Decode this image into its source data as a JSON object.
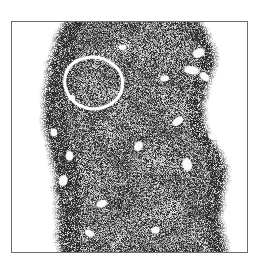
{
  "figure": {
    "domain": "Natural-Image",
    "kind": "histopathology-micrograph",
    "caption": "",
    "modality": "light microscopy, grayscale",
    "title": ""
  },
  "frame": {
    "x": 11,
    "y": 21,
    "width": 237,
    "height": 232,
    "border_color": "#6b6b6b",
    "border_width": 1,
    "background_color": "#ffffff"
  },
  "image": {
    "background_color": "#ffffff",
    "tissue_mid_gray": "#8f8f8f",
    "tissue_dark_gray": "#3a3a3a",
    "tissue_light_gray": "#c9c9c9",
    "speckle_black": "#1a1a1a",
    "lacuna_white": "#fbfbfb",
    "description": "Dense speckled lymphoid tissue band running top to bottom, occupying the left-centre through right of the frame, with white slide background along the left margin and upper-right corner.",
    "tissue_outline_left": [
      [
        0.2,
        0.0
      ],
      [
        0.165,
        0.06
      ],
      [
        0.145,
        0.13
      ],
      [
        0.125,
        0.21
      ],
      [
        0.115,
        0.3
      ],
      [
        0.112,
        0.39
      ],
      [
        0.118,
        0.47
      ],
      [
        0.132,
        0.55
      ],
      [
        0.15,
        0.62
      ],
      [
        0.162,
        0.69
      ],
      [
        0.168,
        0.76
      ],
      [
        0.17,
        0.84
      ],
      [
        0.172,
        0.92
      ],
      [
        0.178,
        1.0
      ]
    ],
    "tissue_outline_right": [
      [
        0.82,
        0.0
      ],
      [
        0.855,
        0.05
      ],
      [
        0.875,
        0.11
      ],
      [
        0.88,
        0.18
      ],
      [
        0.862,
        0.25
      ],
      [
        0.84,
        0.32
      ],
      [
        0.832,
        0.39
      ],
      [
        0.845,
        0.46
      ],
      [
        0.88,
        0.52
      ],
      [
        0.915,
        0.58
      ],
      [
        0.935,
        0.64
      ],
      [
        0.93,
        0.71
      ],
      [
        0.912,
        0.78
      ],
      [
        0.905,
        0.85
      ],
      [
        0.915,
        0.92
      ],
      [
        0.93,
        1.0
      ]
    ]
  },
  "annotation": {
    "type": "hand-drawn-circle",
    "color": "#ffffff",
    "stroke_width": 3,
    "label": "",
    "center_x": 0.345,
    "center_y": 0.262,
    "radius_x": 0.125,
    "radius_y": 0.118,
    "vertices": [
      [
        0.27,
        0.17
      ],
      [
        0.32,
        0.152
      ],
      [
        0.372,
        0.152
      ],
      [
        0.414,
        0.172
      ],
      [
        0.45,
        0.2
      ],
      [
        0.47,
        0.238
      ],
      [
        0.472,
        0.282
      ],
      [
        0.458,
        0.322
      ],
      [
        0.43,
        0.352
      ],
      [
        0.392,
        0.372
      ],
      [
        0.348,
        0.38
      ],
      [
        0.306,
        0.372
      ],
      [
        0.268,
        0.352
      ],
      [
        0.24,
        0.32
      ],
      [
        0.224,
        0.28
      ],
      [
        0.224,
        0.236
      ],
      [
        0.24,
        0.198
      ]
    ]
  },
  "features": {
    "follicle_centers": [
      {
        "cx": 0.345,
        "cy": 0.262,
        "r": 0.1,
        "tone": "#a8a8a8"
      },
      {
        "cx": 0.56,
        "cy": 0.135,
        "r": 0.072,
        "tone": "#a4a4a4"
      },
      {
        "cx": 0.64,
        "cy": 0.33,
        "r": 0.078,
        "tone": "#a6a6a6"
      },
      {
        "cx": 0.42,
        "cy": 0.48,
        "r": 0.085,
        "tone": "#a2a2a2"
      },
      {
        "cx": 0.6,
        "cy": 0.6,
        "r": 0.08,
        "tone": "#a5a5a5"
      },
      {
        "cx": 0.38,
        "cy": 0.7,
        "r": 0.09,
        "tone": "#a6a6a6"
      },
      {
        "cx": 0.68,
        "cy": 0.82,
        "r": 0.075,
        "tone": "#a3a3a3"
      },
      {
        "cx": 0.3,
        "cy": 0.88,
        "r": 0.065,
        "tone": "#a4a4a4"
      },
      {
        "cx": 0.79,
        "cy": 0.47,
        "r": 0.06,
        "tone": "#a0a0a0"
      }
    ],
    "lacunae": [
      {
        "cx": 0.795,
        "cy": 0.135,
        "rx": 0.022,
        "ry": 0.014,
        "rot": -25
      },
      {
        "cx": 0.765,
        "cy": 0.21,
        "rx": 0.028,
        "ry": 0.013,
        "rot": 10
      },
      {
        "cx": 0.82,
        "cy": 0.238,
        "rx": 0.02,
        "ry": 0.012,
        "rot": 40
      },
      {
        "cx": 0.65,
        "cy": 0.245,
        "rx": 0.016,
        "ry": 0.01,
        "rot": 0
      },
      {
        "cx": 0.705,
        "cy": 0.432,
        "rx": 0.022,
        "ry": 0.012,
        "rot": -35
      },
      {
        "cx": 0.855,
        "cy": 0.498,
        "rx": 0.017,
        "ry": 0.011,
        "rot": 20
      },
      {
        "cx": 0.538,
        "cy": 0.54,
        "rx": 0.013,
        "ry": 0.019,
        "rot": 30
      },
      {
        "cx": 0.745,
        "cy": 0.62,
        "rx": 0.015,
        "ry": 0.024,
        "rot": -15
      },
      {
        "cx": 0.245,
        "cy": 0.582,
        "rx": 0.012,
        "ry": 0.018,
        "rot": 0
      },
      {
        "cx": 0.218,
        "cy": 0.69,
        "rx": 0.014,
        "ry": 0.02,
        "rot": 15
      },
      {
        "cx": 0.382,
        "cy": 0.79,
        "rx": 0.02,
        "ry": 0.011,
        "rot": -20
      },
      {
        "cx": 0.33,
        "cy": 0.918,
        "rx": 0.018,
        "ry": 0.01,
        "rot": 25
      },
      {
        "cx": 0.61,
        "cy": 0.905,
        "rx": 0.016,
        "ry": 0.011,
        "rot": -10
      },
      {
        "cx": 0.47,
        "cy": 0.11,
        "rx": 0.013,
        "ry": 0.009,
        "rot": 0
      },
      {
        "cx": 0.255,
        "cy": 0.33,
        "rx": 0.012,
        "ry": 0.009,
        "rot": 0
      },
      {
        "cx": 0.178,
        "cy": 0.48,
        "rx": 0.011,
        "ry": 0.015,
        "rot": 0
      }
    ]
  }
}
